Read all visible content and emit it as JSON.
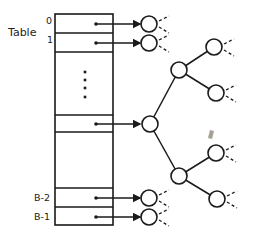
{
  "diagram": {
    "title_label": "Table",
    "table": {
      "x": 55,
      "y": 14,
      "width": 58,
      "height": 211,
      "row_dividers": [
        33,
        52,
        115,
        132,
        188,
        207
      ],
      "row_labels": [
        {
          "text": "0",
          "x": 46,
          "y": 24
        },
        {
          "text": "1",
          "x": 47,
          "y": 43
        },
        {
          "text": "B-2",
          "x": 34,
          "y": 201
        },
        {
          "text": "B-1",
          "x": 34,
          "y": 220
        }
      ],
      "ellipsis_dots": [
        72,
        80,
        88,
        97
      ],
      "ellipsis_x": 85
    },
    "pointers": [
      {
        "from_x": 96,
        "y": 24,
        "to_x": 140
      },
      {
        "from_x": 96,
        "y": 43,
        "to_x": 140
      },
      {
        "from_x": 96,
        "y": 124,
        "to_x": 140
      },
      {
        "from_x": 96,
        "y": 198,
        "to_x": 140
      },
      {
        "from_x": 96,
        "y": 217,
        "to_x": 140
      }
    ],
    "nodes": [
      {
        "id": "n0",
        "cx": 149,
        "cy": 24,
        "r": 8,
        "stubs": true
      },
      {
        "id": "n1",
        "cx": 149,
        "cy": 43,
        "r": 8,
        "stubs": true
      },
      {
        "id": "root",
        "cx": 150,
        "cy": 124,
        "r": 8,
        "stubs": false
      },
      {
        "id": "upper",
        "cx": 179,
        "cy": 70,
        "r": 8,
        "stubs": false
      },
      {
        "id": "upper-a",
        "cx": 214,
        "cy": 47,
        "r": 8,
        "stubs": true
      },
      {
        "id": "upper-b",
        "cx": 216,
        "cy": 93,
        "r": 8,
        "stubs": true
      },
      {
        "id": "lower",
        "cx": 179,
        "cy": 176,
        "r": 8,
        "stubs": false
      },
      {
        "id": "lower-a",
        "cx": 216,
        "cy": 153,
        "r": 8,
        "stubs": true
      },
      {
        "id": "lower-b",
        "cx": 217,
        "cy": 199,
        "r": 8,
        "stubs": true
      },
      {
        "id": "nB2",
        "cx": 149,
        "cy": 198,
        "r": 8,
        "stubs": true
      },
      {
        "id": "nB1",
        "cx": 149,
        "cy": 217,
        "r": 8,
        "stubs": true
      }
    ],
    "edges": [
      [
        "root",
        "upper"
      ],
      [
        "upper",
        "upper-a"
      ],
      [
        "upper",
        "upper-b"
      ],
      [
        "root",
        "lower"
      ],
      [
        "lower",
        "lower-a"
      ],
      [
        "lower",
        "lower-b"
      ]
    ],
    "smudge": {
      "x": 208,
      "y": 130,
      "color": "#8a8070"
    }
  }
}
